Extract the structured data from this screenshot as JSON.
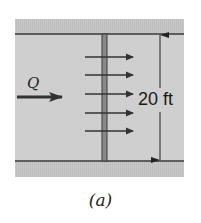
{
  "figure": {
    "caption": "(a)",
    "flow_label": "Q",
    "dimension_label": "20 ft",
    "velocity_arrow_count": 5,
    "colors": {
      "background": "#ffffff",
      "channel_fill": "#cfcfcf",
      "bank_fill": "#c4c4c4",
      "lines": "#3a3a3a",
      "gauge_bar": "#8a8a8a"
    }
  }
}
